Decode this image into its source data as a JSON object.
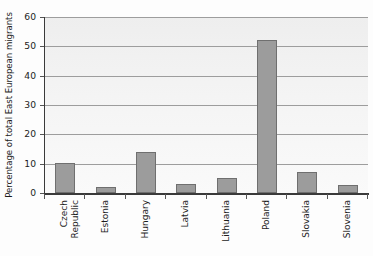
{
  "chart_data": {
    "type": "bar",
    "title": "",
    "xlabel": "",
    "ylabel": "Percentage of total East European migrants",
    "categories": [
      "Czech Republic",
      "Estonia",
      "Hungary",
      "Latvia",
      "Lithuania",
      "Poland",
      "Slovakia",
      "Slovenia"
    ],
    "category_lines": [
      [
        "Czech",
        "Republic"
      ],
      [
        "Estonia"
      ],
      [
        "Hungary"
      ],
      [
        "Latvia"
      ],
      [
        "Lithuania"
      ],
      [
        "Poland"
      ],
      [
        "Slovakia"
      ],
      [
        "Slovenia"
      ]
    ],
    "values": [
      10.2,
      2.0,
      14.0,
      3.0,
      5.0,
      52.0,
      7.0,
      2.8
    ],
    "ylim": [
      0,
      60
    ],
    "yticks": [
      0,
      10,
      20,
      30,
      40,
      50,
      60
    ],
    "ytick_labels": [
      "0",
      "10",
      "20",
      "30",
      "40",
      "50",
      "60"
    ],
    "grid": "horizontal",
    "legend": "none",
    "bar_color": "#9c9c9c",
    "bar_border_color": "#6f6f6f",
    "axis_color": "#3a3a3a",
    "gridline_color": "#9d9d9d",
    "plot_background": "#f2f2f2"
  }
}
